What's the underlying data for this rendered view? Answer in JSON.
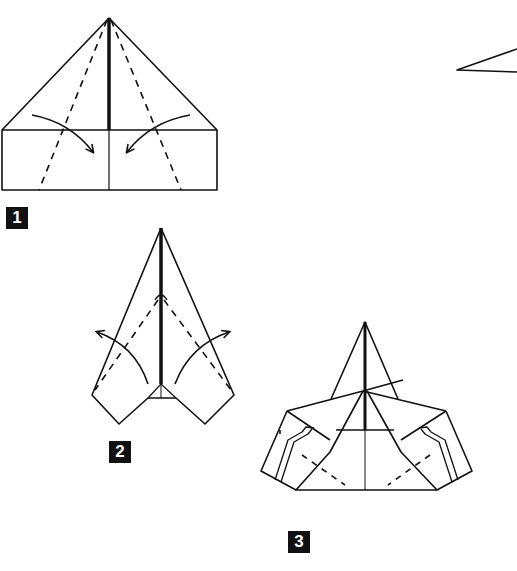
{
  "diagram": {
    "type": "origami-instructions",
    "line_color": "#111111",
    "background": "#ffffff",
    "steps": [
      {
        "number": "1",
        "description": "Top corners already folded to center; fold along dashed lines toward center (arrows inward)"
      },
      {
        "number": "2",
        "description": "Narrow dart shape; unfold/fold flaps outward along dashed lines (arrows outward)"
      },
      {
        "number": "3",
        "description": "Wings spread with pleated tips and dashed fold lines"
      }
    ],
    "partial_figure": "edge of airplane visible at top right"
  }
}
